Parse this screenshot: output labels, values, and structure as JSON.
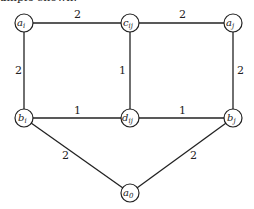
{
  "caption": "ample shown.",
  "nodes": [
    {
      "id": "a_i",
      "base": "a",
      "sub": "i",
      "x": 24,
      "y": 23
    },
    {
      "id": "c_ij",
      "base": "c",
      "sub": "ij",
      "x": 130,
      "y": 23
    },
    {
      "id": "a_j",
      "base": "a",
      "sub": "j",
      "x": 233,
      "y": 23
    },
    {
      "id": "b_i",
      "base": "b",
      "sub": "i",
      "x": 24,
      "y": 118
    },
    {
      "id": "d_ij",
      "base": "d",
      "sub": "ij",
      "x": 130,
      "y": 118
    },
    {
      "id": "b_j",
      "base": "b",
      "sub": "j",
      "x": 233,
      "y": 118
    },
    {
      "id": "a_0",
      "base": "a",
      "sub": "0",
      "x": 130,
      "y": 193
    }
  ],
  "edges": [
    {
      "from": "a_i",
      "to": "c_ij",
      "weight": "2"
    },
    {
      "from": "c_ij",
      "to": "a_j",
      "weight": "2"
    },
    {
      "from": "a_i",
      "to": "b_i",
      "weight": "2"
    },
    {
      "from": "c_ij",
      "to": "d_ij",
      "weight": "1"
    },
    {
      "from": "a_j",
      "to": "b_j",
      "weight": "2"
    },
    {
      "from": "b_i",
      "to": "d_ij",
      "weight": "1"
    },
    {
      "from": "d_ij",
      "to": "b_j",
      "weight": "1"
    },
    {
      "from": "b_i",
      "to": "a_0",
      "weight": "2"
    },
    {
      "from": "b_j",
      "to": "a_0",
      "weight": "2"
    }
  ]
}
